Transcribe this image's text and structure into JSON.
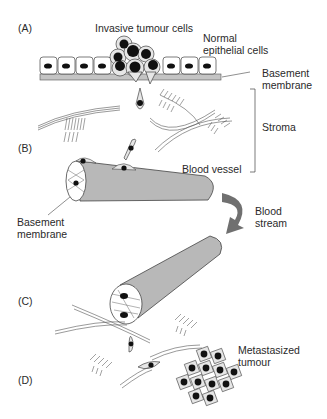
{
  "panels": {
    "a": "(A)",
    "b": "(B)",
    "c": "(C)",
    "d": "(D)"
  },
  "labels": {
    "invasive": "Invasive tumour cells",
    "normal": "Normal\nepithelial cells",
    "basement_top": "Basement\nmembrane",
    "stroma": "Stroma",
    "blood_vessel": "Blood vessel",
    "basement_left": "Basement\nmembrane",
    "blood_stream": "Blood\nstream",
    "metastasized": "Metastasized\ntumour"
  },
  "colors": {
    "vessel": "#b8b8b8",
    "membrane": "#c4c4c4",
    "arrow": "#707070",
    "nucleus": "#111111",
    "cell_fill": "#e6e6e6"
  }
}
